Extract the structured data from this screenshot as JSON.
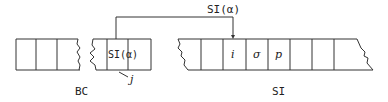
{
  "diagram": {
    "arrow_label": "SI(α)",
    "bc": {
      "label": "BC",
      "cell_label": "SI(α)",
      "pointer_label": "j"
    },
    "si": {
      "label": "SI",
      "cells": [
        "i",
        "σ",
        "p"
      ]
    },
    "colors": {
      "line": "#333333",
      "background": "#ffffff"
    }
  }
}
